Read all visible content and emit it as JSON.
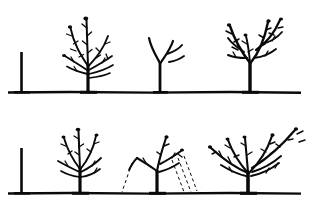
{
  "figure": {
    "title": "Fruit tree training and pruning stages",
    "background_color": "#ffffff",
    "ink_color": "#0a0a0a",
    "width": 309,
    "height": 212,
    "rows": [
      {
        "name": "top-row",
        "ground_y": 92,
        "ground_x_start": 8,
        "ground_x_end": 301,
        "stages": [
          {
            "name": "whip",
            "label": "unbranched whip",
            "trunk_x": 21,
            "top_y": 52
          },
          {
            "name": "young-branched-tree",
            "label": "young branched tree",
            "trunk_x": 88,
            "top_y": 12
          },
          {
            "name": "pruned-framework",
            "label": "pruned framework",
            "trunk_x": 160,
            "top_y": 36
          },
          {
            "name": "developed-tree",
            "label": "developed tree",
            "trunk_x": 250,
            "top_y": 8
          }
        ]
      },
      {
        "name": "bottom-row",
        "ground_y": 193,
        "ground_x_start": 8,
        "ground_x_end": 301,
        "stages": [
          {
            "name": "whip",
            "label": "unbranched whip",
            "trunk_x": 21,
            "top_y": 148
          },
          {
            "name": "young-branched-tree",
            "label": "young branched tree",
            "trunk_x": 80,
            "top_y": 126
          },
          {
            "name": "tree-with-pruning-guides",
            "label": "tree with pruning guide lines",
            "trunk_x": 157,
            "top_y": 136,
            "has_dashed_guides": true
          },
          {
            "name": "mature-spreading-tree",
            "label": "mature spreading tree",
            "trunk_x": 248,
            "top_y": 120
          }
        ]
      }
    ]
  }
}
